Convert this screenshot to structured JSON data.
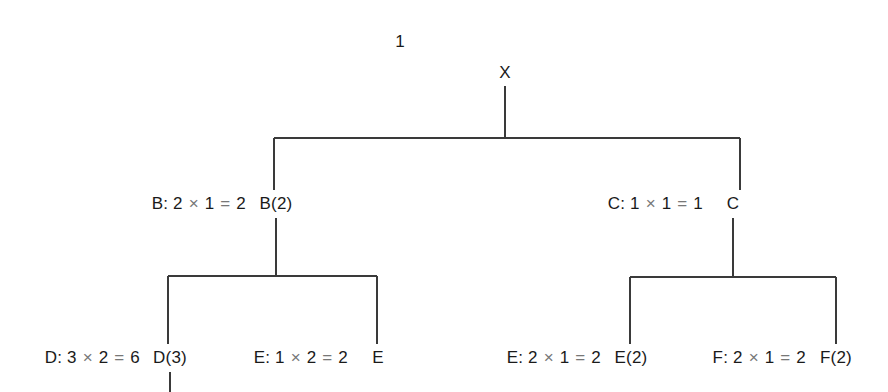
{
  "figure": {
    "corner_label": "1",
    "line_color": "#3a3a3a",
    "text_color": "#1a1a1a",
    "operator_color": "#777777",
    "background": "#ffffff"
  },
  "nodes": [
    {
      "id": "x",
      "label": "X",
      "x": 505,
      "y": 73
    },
    {
      "id": "b",
      "label": "B(2)",
      "x": 276,
      "y": 204
    },
    {
      "id": "c",
      "label": "C",
      "x": 733,
      "y": 204
    },
    {
      "id": "d",
      "label": "D(3)",
      "x": 170,
      "y": 358
    },
    {
      "id": "e1",
      "label": "E",
      "x": 378,
      "y": 358
    },
    {
      "id": "e2",
      "label": "E(2)",
      "x": 631,
      "y": 358
    },
    {
      "id": "f",
      "label": "F(2)",
      "x": 836,
      "y": 358
    }
  ],
  "annotations": [
    {
      "id": "b-annot",
      "text": "B: 2 × 1 = 2",
      "right_x": 246,
      "y": 204
    },
    {
      "id": "c-annot",
      "text": "C: 1 × 1 = 1",
      "right_x": 703,
      "y": 204
    },
    {
      "id": "d-annot",
      "text": "D: 3 × 2 = 6",
      "right_x": 140,
      "y": 358
    },
    {
      "id": "e1-annot",
      "text": "E: 1 × 2 = 2",
      "right_x": 348,
      "y": 358
    },
    {
      "id": "e2-annot",
      "text": "E: 2 × 1 = 2",
      "right_x": 601,
      "y": 358
    },
    {
      "id": "f-annot",
      "text": "F: 2 × 1 = 2",
      "right_x": 806,
      "y": 358
    }
  ],
  "chart_data": {
    "type": "diagram",
    "diagram_kind": "tree",
    "title": "",
    "corner_annotation": "1",
    "tree": {
      "root": {
        "name": "X",
        "children": [
          {
            "name": "B(2)",
            "annotation": "B: 2 × 1 = 2",
            "value": 2,
            "children": [
              {
                "name": "D(3)",
                "annotation": "D: 3 × 2 = 6",
                "value": 6,
                "children": [],
                "has_cut_off_stem": true
              },
              {
                "name": "E",
                "annotation": "E: 1 × 2 = 2",
                "value": 2,
                "children": []
              }
            ]
          },
          {
            "name": "C",
            "annotation": "C: 1 × 1 = 1",
            "value": 1,
            "children": [
              {
                "name": "E(2)",
                "annotation": "E: 2 × 1 = 2",
                "value": 2,
                "children": []
              },
              {
                "name": "F(2)",
                "annotation": "F: 2 × 1 = 2",
                "value": 2,
                "children": []
              }
            ]
          }
        ]
      }
    },
    "edges": [
      {
        "from": "X",
        "to": "B(2)"
      },
      {
        "from": "X",
        "to": "C"
      },
      {
        "from": "B(2)",
        "to": "D(3)"
      },
      {
        "from": "B(2)",
        "to": "E"
      },
      {
        "from": "C",
        "to": "E(2)"
      },
      {
        "from": "C",
        "to": "F(2)"
      }
    ]
  }
}
